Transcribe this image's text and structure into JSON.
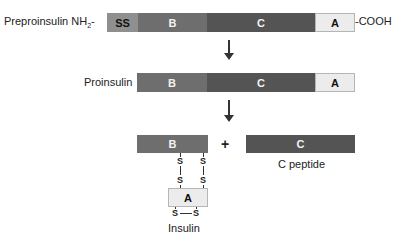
{
  "preproinsulin": {
    "label": "Preproinsulin NH",
    "label_sub": "2",
    "dash": "-",
    "terminal_c": "-COOH",
    "segments": [
      {
        "name": "SS",
        "color": "#8f8f8f"
      },
      {
        "name": "B",
        "color": "#6e6e6e"
      },
      {
        "name": "C",
        "color": "#545454"
      },
      {
        "name": "A",
        "color": "#ececec"
      }
    ]
  },
  "proinsulin": {
    "label": "Proinsulin",
    "segments": [
      {
        "name": "B",
        "color": "#6e6e6e"
      },
      {
        "name": "C",
        "color": "#545454"
      },
      {
        "name": "A",
        "color": "#ececec"
      }
    ]
  },
  "products": {
    "plus": "+",
    "insulin": {
      "label": "Insulin",
      "b_chain": "B",
      "a_chain": "A",
      "disulfide_atom": "S"
    },
    "c_peptide": {
      "segment": "C",
      "label": "C peptide"
    }
  }
}
